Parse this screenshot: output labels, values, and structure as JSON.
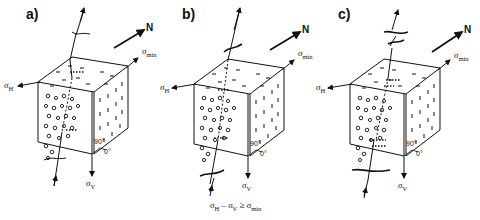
{
  "figure": {
    "panels": [
      {
        "id": "a",
        "label": "a)",
        "fracture": "straight",
        "north": "N",
        "sigma_h": "σ",
        "sigma_h_sub": "H",
        "sigma_min": "σ",
        "sigma_min_sub": "min",
        "sigma_v": "σ",
        "sigma_v_sub": "V",
        "angle_90": "90°",
        "angle_0": "0°"
      },
      {
        "id": "b",
        "label": "b)",
        "fracture": "inclined",
        "north": "N",
        "sigma_h": "σ",
        "sigma_h_sub": "H",
        "sigma_min": "σ",
        "sigma_min_sub": "min",
        "sigma_v": "σ",
        "sigma_v_sub": "V",
        "angle_90": "90°",
        "angle_0": "0°"
      },
      {
        "id": "c",
        "label": "c)",
        "fracture": "rotating",
        "north": "N",
        "sigma_h": "σ",
        "sigma_h_sub": "H",
        "sigma_min": "σ",
        "sigma_min_sub": "min",
        "sigma_v": "σ",
        "sigma_v_sub": "V",
        "angle_90": "90°",
        "angle_0": "0°"
      }
    ],
    "caption": {
      "lhs": "σ",
      "lhs_sub": "H",
      "mid": " – σ",
      "mid_sub": "V",
      "rel": " ≥ σ",
      "rhs_sub": "min"
    }
  }
}
